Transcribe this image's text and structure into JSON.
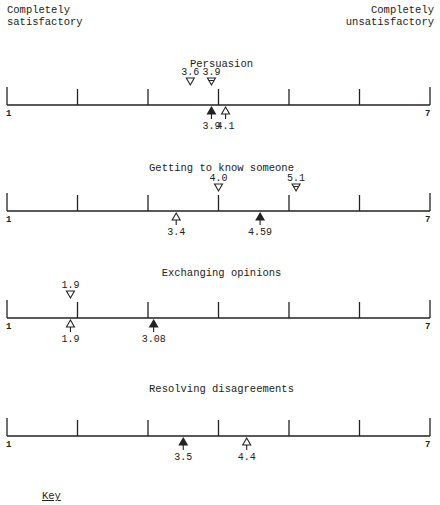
{
  "header": {
    "left_line1": "Completely",
    "left_line2": "satisfactory",
    "right_line1": "Completely",
    "right_line2": "unsatisfactory"
  },
  "key_label": "Key",
  "chart_data": {
    "type": "scatter",
    "title": "",
    "scale": {
      "min": 1,
      "max": 7,
      "min_label": "1",
      "max_label": "7"
    },
    "xlabel_left": "Completely satisfactory",
    "xlabel_right": "Completely unsatisfactory",
    "panels": [
      {
        "title": "Persuasion",
        "markers": [
          {
            "value": 3.6,
            "label": "3.6",
            "position": "above",
            "style": "open-down-triangle"
          },
          {
            "value": 3.9,
            "label": "3.9",
            "position": "above",
            "style": "marked-down-triangle"
          },
          {
            "value": 3.9,
            "label": "3.9",
            "position": "below",
            "style": "filled-up-arrow"
          },
          {
            "value": 4.1,
            "label": "4.1",
            "position": "below",
            "style": "open-up-arrow"
          }
        ]
      },
      {
        "title": "Getting to know someone",
        "markers": [
          {
            "value": 4.0,
            "label": "4.0",
            "position": "above",
            "style": "open-down-triangle"
          },
          {
            "value": 5.1,
            "label": "5.1",
            "position": "above",
            "style": "marked-down-triangle"
          },
          {
            "value": 3.4,
            "label": "3.4",
            "position": "below",
            "style": "open-up-arrow"
          },
          {
            "value": 4.59,
            "label": "4.59",
            "position": "below",
            "style": "filled-up-arrow"
          }
        ]
      },
      {
        "title": "Exchanging opinions",
        "markers": [
          {
            "value": 1.9,
            "label": "1.9",
            "position": "above",
            "style": "open-down-triangle"
          },
          {
            "value": 1.9,
            "label": "1.9",
            "position": "below",
            "style": "open-up-arrow"
          },
          {
            "value": 3.08,
            "label": "3.08",
            "position": "below",
            "style": "filled-up-arrow"
          }
        ]
      },
      {
        "title": "Resolving disagreements",
        "markers": [
          {
            "value": 3.5,
            "label": "3.5",
            "position": "below",
            "style": "filled-up-arrow"
          },
          {
            "value": 4.4,
            "label": "4.4",
            "position": "below",
            "style": "open-up-arrow"
          }
        ]
      }
    ],
    "layout": {
      "grid": false,
      "legend": "Key (bottom-left)"
    }
  }
}
